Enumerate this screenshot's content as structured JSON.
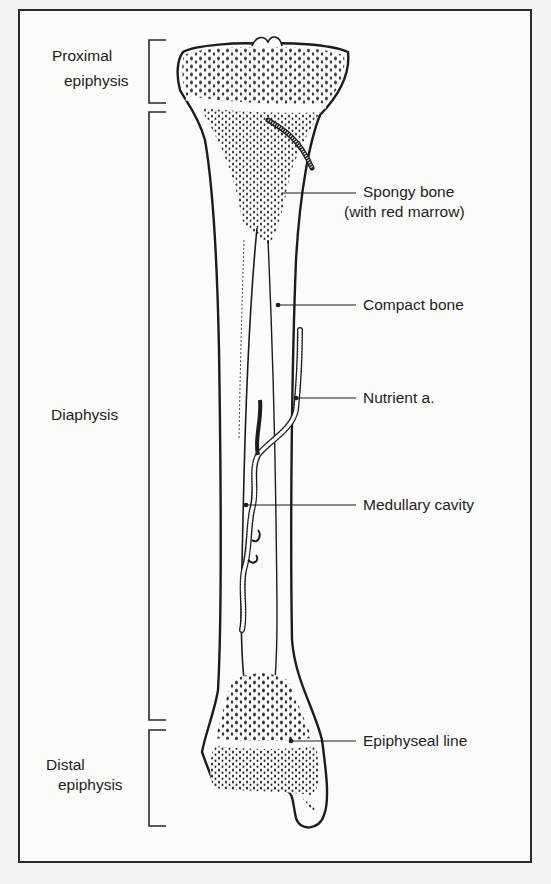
{
  "figure": {
    "left_labels": {
      "proximal_epiphysis": [
        "Proximal",
        "epiphysis"
      ],
      "diaphysis": "Diaphysis",
      "distal_epiphysis": [
        "Distal",
        "epiphysis"
      ]
    },
    "right_labels": {
      "spongy_bone": "Spongy bone",
      "spongy_bone_note": "(with red marrow)",
      "compact_bone": "Compact bone",
      "nutrient_artery": "Nutrient a.",
      "medullary_cavity": "Medullary cavity",
      "epiphyseal_line": "Epiphyseal line"
    },
    "colors": {
      "ink": "#1c1c1c",
      "paper": "#fbfbfa",
      "background": "#f4f4f2"
    }
  }
}
